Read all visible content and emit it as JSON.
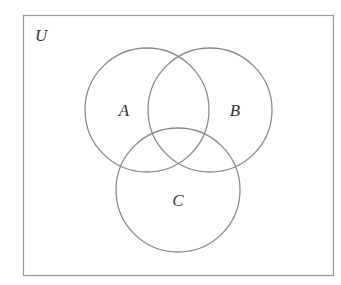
{
  "diagram": {
    "type": "venn",
    "universe": {
      "label": "U",
      "x": 23,
      "y": 15,
      "width": 310,
      "height": 260
    },
    "sets": [
      {
        "label": "A",
        "cx": 147,
        "cy": 110,
        "r": 62,
        "label_x": 124,
        "label_y": 116
      },
      {
        "label": "B",
        "cx": 210,
        "cy": 110,
        "r": 62,
        "label_x": 235,
        "label_y": 116
      },
      {
        "label": "C",
        "cx": 178,
        "cy": 190,
        "r": 62,
        "label_x": 178,
        "label_y": 206
      }
    ],
    "colors": {
      "stroke": "#8a8a8a",
      "frame": "#999999",
      "text": "#333333",
      "background": "#ffffff"
    }
  }
}
